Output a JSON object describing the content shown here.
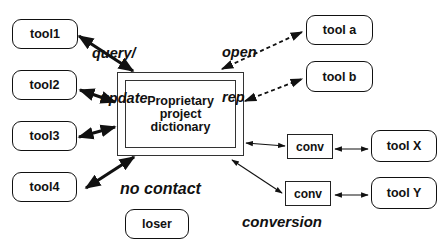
{
  "diagram": {
    "central": {
      "label_lines": [
        "Proprietary",
        "project",
        "dictionary"
      ]
    },
    "tools_left": [
      {
        "id": "tool1",
        "label": "tool1"
      },
      {
        "id": "tool2",
        "label": "tool2"
      },
      {
        "id": "tool3",
        "label": "tool3"
      },
      {
        "id": "tool4",
        "label": "tool4"
      }
    ],
    "tools_right": [
      {
        "id": "tool-a",
        "label": "tool a"
      },
      {
        "id": "tool-b",
        "label": "tool b"
      },
      {
        "id": "tool-x",
        "label": "tool X"
      },
      {
        "id": "tool-y",
        "label": "tool Y"
      }
    ],
    "isolated": {
      "label": "loser"
    },
    "converters": [
      {
        "label": "conv"
      },
      {
        "label": "conv"
      }
    ],
    "annotations": {
      "query_update": [
        "query/",
        "update"
      ],
      "open_rep": [
        "open",
        "rep"
      ],
      "no_contact": "no contact",
      "conversion": "conversion"
    },
    "edges": [
      {
        "from": "tool1",
        "to": "central",
        "style": "thick-solid",
        "bidirectional": true
      },
      {
        "from": "tool2",
        "to": "central",
        "style": "thick-solid",
        "bidirectional": true
      },
      {
        "from": "tool3",
        "to": "central",
        "style": "thick-solid",
        "bidirectional": true
      },
      {
        "from": "tool4",
        "to": "central",
        "style": "thick-solid",
        "bidirectional": true
      },
      {
        "from": "tool a",
        "to": "central",
        "style": "dashed",
        "bidirectional": true
      },
      {
        "from": "tool b",
        "to": "central",
        "style": "dashed",
        "bidirectional": true
      },
      {
        "from": "central",
        "to": "conv",
        "style": "thin-solid",
        "bidirectional": true
      },
      {
        "from": "conv",
        "to": "tool X",
        "style": "thin-solid",
        "bidirectional": true
      },
      {
        "from": "central",
        "to": "conv",
        "style": "thin-solid",
        "bidirectional": true
      },
      {
        "from": "conv",
        "to": "tool Y",
        "style": "thin-solid",
        "bidirectional": true
      }
    ]
  }
}
